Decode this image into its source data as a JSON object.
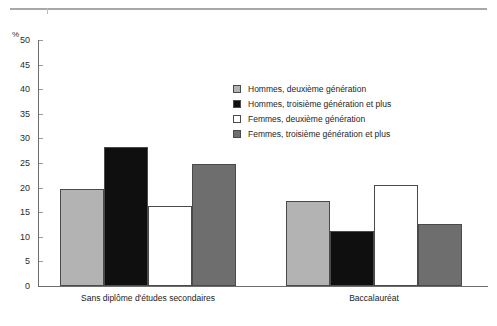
{
  "chart_data": {
    "type": "bar",
    "title": "",
    "subtitle": "",
    "xlabel": "",
    "ylabel": "%",
    "ylim": [
      0,
      50
    ],
    "ytick_step": 5,
    "yticks": [
      "50",
      "45",
      "40",
      "35",
      "30",
      "25",
      "20",
      "15",
      "10",
      "5",
      "0"
    ],
    "grid": false,
    "legend_position": "inside-upper-right",
    "categories": [
      "Sans diplôme d'études secondaires",
      "Baccalauréat"
    ],
    "series": [
      {
        "name": "Hommes, deuxième génération",
        "color": "#b3b3b3",
        "values": [
          19.7,
          17.2
        ]
      },
      {
        "name": "Hommes, troisième génération et plus",
        "color": "#100f0f",
        "values": [
          28.3,
          11.2
        ]
      },
      {
        "name": "Femmes, deuxième génération",
        "color": "#ffffff",
        "values": [
          16.3,
          20.5
        ]
      },
      {
        "name": "Femmes, troisième génération et plus",
        "color": "#6e6e6e",
        "values": [
          24.7,
          12.6
        ]
      }
    ]
  },
  "axis": {
    "unit_label": "%"
  },
  "legend": {
    "entries": [
      {
        "label": "Hommes, deuxième génération",
        "color": "#b3b3b3"
      },
      {
        "label": "Hommes, troisième génération et plus",
        "color": "#100f0f"
      },
      {
        "label": "Femmes, deuxième génération",
        "color": "#ffffff"
      },
      {
        "label": "Femmes, troisième génération et plus",
        "color": "#6e6e6e"
      }
    ]
  }
}
